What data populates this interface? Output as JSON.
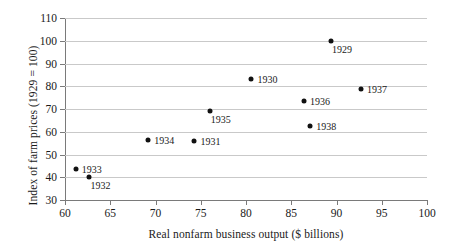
{
  "chart_data": {
    "type": "scatter",
    "title": "",
    "xlabel": "Real nonfarm business output ($ billions)",
    "ylabel": "Index of farm prices (1929 = 100)",
    "xlim": [
      60,
      100
    ],
    "ylim": [
      30,
      110
    ],
    "xticks": [
      60,
      65,
      70,
      75,
      80,
      85,
      90,
      95,
      100
    ],
    "yticks": [
      30,
      40,
      50,
      60,
      70,
      80,
      90,
      100,
      110
    ],
    "grid": "horizontal",
    "legend": "none",
    "marker_color": "#111111",
    "grid_color": "#c9c9c9",
    "axis_color": "#7a7a7a",
    "points": [
      {
        "label": "1929",
        "x": 89.4,
        "y": 100.0,
        "label_pos": "belowright"
      },
      {
        "label": "1930",
        "x": 80.6,
        "y": 83.0,
        "label_pos": "right"
      },
      {
        "label": "1931",
        "x": 74.3,
        "y": 55.8,
        "label_pos": "right"
      },
      {
        "label": "1932",
        "x": 62.7,
        "y": 40.0,
        "label_pos": "belowright"
      },
      {
        "label": "1933",
        "x": 61.2,
        "y": 43.7,
        "label_pos": "right"
      },
      {
        "label": "1934",
        "x": 69.2,
        "y": 56.4,
        "label_pos": "right"
      },
      {
        "label": "1935",
        "x": 76.0,
        "y": 69.3,
        "label_pos": "belowright"
      },
      {
        "label": "1936",
        "x": 86.4,
        "y": 73.4,
        "label_pos": "right"
      },
      {
        "label": "1937",
        "x": 92.7,
        "y": 79.0,
        "label_pos": "right"
      },
      {
        "label": "1938",
        "x": 87.1,
        "y": 62.7,
        "label_pos": "right"
      }
    ]
  }
}
